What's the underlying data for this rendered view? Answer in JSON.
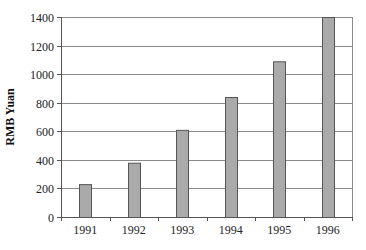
{
  "chart_data": {
    "type": "bar",
    "title": "",
    "xlabel": "",
    "ylabel": "RMB Yuan",
    "categories": [
      "1991",
      "1992",
      "1993",
      "1994",
      "1995",
      "1996"
    ],
    "values": [
      230,
      380,
      610,
      840,
      1090,
      1400
    ],
    "ylim": [
      0,
      1400
    ],
    "yticks": [
      0,
      200,
      400,
      600,
      800,
      1000,
      1200,
      1400
    ],
    "grid": true,
    "legend": null,
    "colors": {
      "bar_fill": "#aaaaaa",
      "bar_edge": "#555555",
      "grid": "#8a8a8a",
      "axis": "#555555"
    }
  }
}
